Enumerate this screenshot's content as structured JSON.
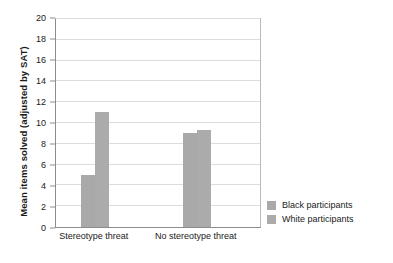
{
  "chart_data": {
    "type": "bar",
    "title": "",
    "xlabel": "",
    "ylabel": "Mean items solved (adjusted by SAT)",
    "categories": [
      "Stereotype threat",
      "No stereotype threat"
    ],
    "series": [
      {
        "name": "Black participants",
        "values": [
          5.0,
          9.0
        ],
        "color": "#a9a9a9"
      },
      {
        "name": "White participants",
        "values": [
          11.1,
          9.3
        ],
        "color": "#ababab"
      }
    ],
    "ylim": [
      0,
      20
    ],
    "ytick_values": [
      0,
      2,
      4,
      6,
      8,
      10,
      12,
      14,
      16,
      18,
      20
    ],
    "ytick_labels": [
      "0",
      "2",
      "4",
      "6",
      "8",
      "10",
      "12",
      "14",
      "16",
      "18",
      "20"
    ],
    "grid": true,
    "grid_axis": "y",
    "legend_position": "right",
    "legend_entries": [
      "Black participants",
      "White participants"
    ],
    "annotations": []
  },
  "legend": {
    "rows": [
      {
        "label": "Black participants",
        "swatch": "legend-swatch-black-participants"
      },
      {
        "label": "White participants",
        "swatch": "legend-swatch-white-participants"
      }
    ]
  }
}
